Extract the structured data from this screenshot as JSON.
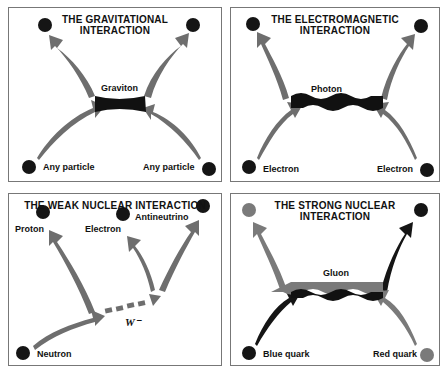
{
  "panels": {
    "gravitational": {
      "title_line1": "THE GRAVITATIONAL",
      "title_line2": "INTERACTION",
      "mediator": "Graviton",
      "bottom_left": "Any particle",
      "bottom_right": "Any particle"
    },
    "electromagnetic": {
      "title_line1": "THE ELECTROMAGNETIC",
      "title_line2": "INTERACTION",
      "mediator": "Photon",
      "bottom_left": "Electron",
      "bottom_right": "Electron"
    },
    "weak": {
      "title_line1": "THE WEAK NUCLEAR INTERACTION",
      "mediator": "W⁻",
      "top_left": "Proton",
      "top_mid": "Electron",
      "top_right": "Antineutrino",
      "bottom_left": "Neutron"
    },
    "strong": {
      "title_line1": "THE STRONG NUCLEAR",
      "title_line2": "INTERACTION",
      "mediator": "Gluon",
      "bottom_left": "Blue quark",
      "bottom_right": "Red quark"
    }
  },
  "colors": {
    "arrow_gray": "#6e6e6e",
    "particle_dark": "#151515",
    "quark_gray": "#7a7a7a"
  }
}
